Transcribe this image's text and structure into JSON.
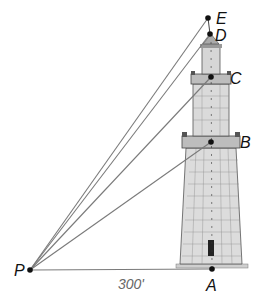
{
  "diagram": {
    "points": {
      "P": {
        "label": "P",
        "x": 30,
        "y": 270
      },
      "A": {
        "label": "A",
        "x": 212,
        "y": 269
      },
      "B": {
        "label": "B",
        "x": 211,
        "y": 142
      },
      "C": {
        "label": "C",
        "x": 211,
        "y": 77
      },
      "D": {
        "label": "D",
        "x": 210,
        "y": 34
      },
      "E": {
        "label": "E",
        "x": 208,
        "y": 18
      }
    },
    "segments": [
      "PA",
      "PB",
      "PC",
      "PD",
      "PE",
      "AE"
    ],
    "distance_label": "300'",
    "colors": {
      "line": "#7a7a7a",
      "point": "#111111",
      "tower_fill": "#d9d9d9",
      "tower_stroke": "#555555"
    }
  }
}
